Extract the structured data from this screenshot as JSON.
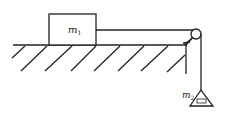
{
  "diagram": {
    "block1": {
      "label": "m",
      "subscript": "1"
    },
    "block2": {
      "label": "m",
      "subscript": "2"
    },
    "colors": {
      "line": "#222222",
      "background": "#ffffff"
    }
  }
}
